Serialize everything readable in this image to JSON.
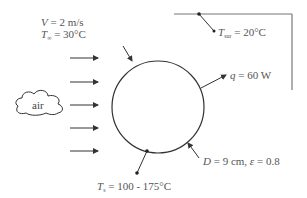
{
  "diagram": {
    "flow": {
      "velocity_symbol": "V",
      "velocity_value": " = 2 m/s",
      "temp_symbol": "T",
      "temp_sub": "∞",
      "temp_value": " = 30°C",
      "fluid_label": "air",
      "arrow_count": 6
    },
    "surroundings": {
      "symbol": "T",
      "sub": "sur",
      "value": " = 20°C"
    },
    "heat": {
      "symbol": "q",
      "value": " = 60 W"
    },
    "sphere": {
      "diameter_symbol": "D",
      "diameter_value": " = 9 cm, ",
      "emissivity_symbol": "ε",
      "emissivity_value": " = 0.8",
      "surface_temp_symbol": "T",
      "surface_temp_sub": "s",
      "surface_temp_value": " = 100 - 175°C"
    },
    "colors": {
      "line": "#333333",
      "text": "#555555",
      "frame": "#777777"
    }
  }
}
